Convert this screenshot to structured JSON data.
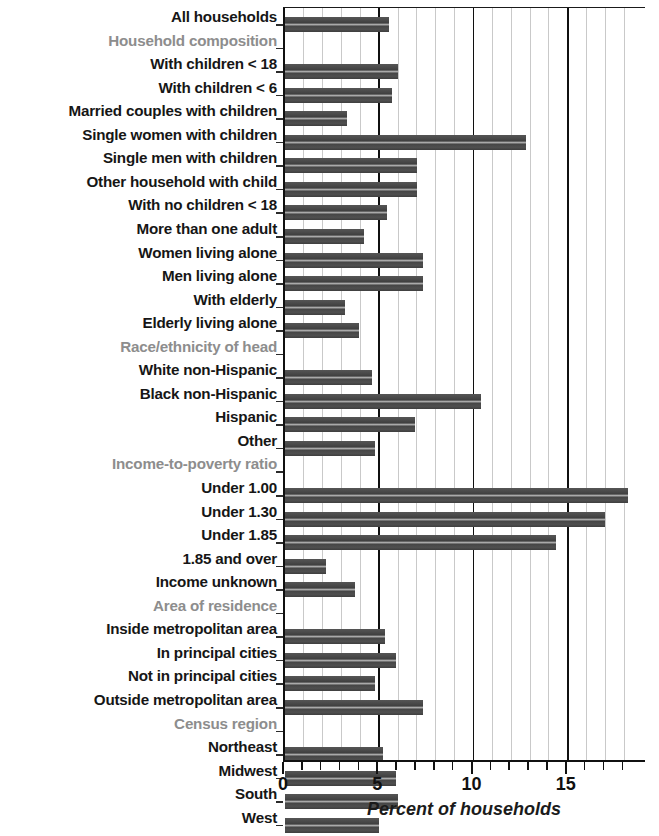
{
  "chart_data": {
    "type": "bar",
    "orientation": "horizontal",
    "title": "",
    "xlabel": "Percent of households",
    "ylabel": "",
    "xlim": [
      0,
      18.4
    ],
    "xticks": [
      0,
      5,
      10,
      15
    ],
    "xtick_labels": [
      "0",
      "5",
      "10",
      "15"
    ],
    "minor_tick_step": 1,
    "grid": "vertical",
    "legend": "none",
    "bar_color": "#4c4c4c",
    "section_header_color": "#8d8d8d",
    "label_color": "#161616",
    "categories": [
      "All households",
      "Household composition",
      "With children < 18",
      "With children < 6",
      "Married couples with children",
      "Single women with children",
      "Single men with children",
      "Other household with child",
      "With no children < 18",
      "More than one adult",
      "Women living alone",
      "Men living alone",
      "With elderly",
      "Elderly living alone",
      "Race/ethnicity of head",
      "White non-Hispanic",
      "Black non-Hispanic",
      "Hispanic",
      "Other",
      "Income-to-poverty ratio",
      "Under 1.00",
      "Under 1.30",
      "Under 1.85",
      "1.85 and over",
      "Income unknown",
      "Area of residence",
      "Inside metropolitan area",
      "In principal cities",
      "Not in principal cities",
      "Outside metropolitan area",
      "Census region",
      "Northeast",
      "Midwest",
      "South",
      "West"
    ],
    "values": [
      5.5,
      null,
      6.0,
      5.7,
      3.3,
      12.8,
      7.0,
      7.0,
      5.4,
      4.2,
      7.3,
      7.3,
      3.2,
      3.9,
      null,
      4.6,
      10.4,
      6.9,
      4.8,
      null,
      18.2,
      17.0,
      14.4,
      2.2,
      3.7,
      null,
      5.3,
      5.9,
      4.8,
      7.3,
      null,
      5.2,
      5.9,
      6.0,
      5.0
    ],
    "section_headers": [
      "Household composition",
      "Race/ethnicity of head",
      "Income-to-poverty ratio",
      "Area of residence",
      "Census region"
    ]
  }
}
